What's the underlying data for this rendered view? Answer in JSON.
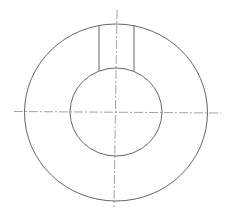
{
  "diagram": {
    "type": "technical-drawing",
    "colors": {
      "background": "#ffffff",
      "outline": "#555555",
      "centerline": "#8a8a8a"
    },
    "outer_circle": {
      "cx": 116,
      "cy": 112.5,
      "rx": 91.5,
      "ry": 88.5
    },
    "inner_circle": {
      "cx": 116,
      "cy": 112,
      "rx": 46,
      "ry": 44
    },
    "keyway_slot": {
      "x_left": 99,
      "x_right": 134,
      "y_top_left": 25.5,
      "y_top_right": 25.5,
      "y_bottom_left": 71,
      "y_bottom_right": 71.5
    },
    "centerlines": {
      "horizontal": {
        "x1": 14,
        "y1": 111.5,
        "x2": 221,
        "y2": 113
      },
      "vertical": {
        "x1": 117,
        "y1": 10,
        "x2": 114,
        "y2": 207
      }
    }
  }
}
